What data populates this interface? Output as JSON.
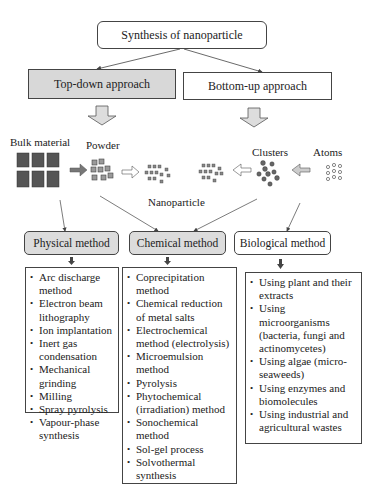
{
  "title": "Synthesis of nanoparticle",
  "approaches": {
    "top_down": "Top-down approach",
    "bottom_up": "Bottom-up approach"
  },
  "materials": {
    "bulk": "Bulk material",
    "powder": "Powder",
    "nanoparticle": "Nanoparticle",
    "clusters": "Clusters",
    "atoms": "Atoms"
  },
  "methods": {
    "physical": {
      "label": "Physical method",
      "items": [
        "Arc discharge method",
        "Electron beam lithography",
        "Ion implantation",
        "Inert gas condensation",
        "Mechanical grinding",
        "Milling",
        "Spray pyrolysis",
        "Vapour-phase synthesis"
      ]
    },
    "chemical": {
      "label": "Chemical method",
      "items": [
        "Coprecipitation method",
        "Chemical reduction of metal salts",
        "Electrochemical method (electrolysis)",
        "Microemulsion method",
        "Pyrolysis",
        "Phytochemical (irradiation) method",
        "Sonochemical method",
        "Sol-gel process",
        "Solvothermal synthesis"
      ]
    },
    "biological": {
      "label": "Biological method",
      "items": [
        "Using plant and their extracts",
        "Using microorganisms (bacteria, fungi and actinomycetes)",
        "Using algae (micro-seaweeds)",
        "Using enzymes and biomolecules",
        "Using industrial and agricultural wastes"
      ]
    }
  },
  "colors": {
    "shaded_box": "#d8d8d8",
    "cube": "#555555",
    "line": "#444444"
  }
}
